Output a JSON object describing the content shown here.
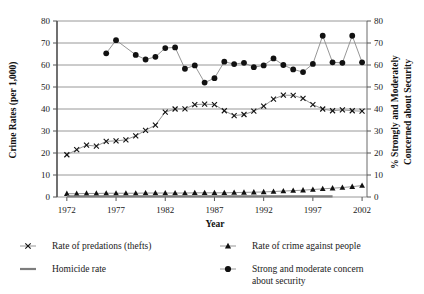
{
  "chart_data": {
    "type": "line",
    "title": "",
    "xlabel": "Year",
    "ylabel": "Crime Rates (per 1,000)",
    "y2label": "% Strongly and Moderately Concerned about Security",
    "xlim": [
      1971,
      2002.5
    ],
    "ylim": [
      0,
      80
    ],
    "y2lim": [
      0,
      80
    ],
    "grid": true,
    "legend_position": "bottom",
    "xticks": [
      "1972",
      "1977",
      "1982",
      "1987",
      "1992",
      "1997",
      "2002"
    ],
    "xtick_values": [
      1972,
      1977,
      1982,
      1987,
      1992,
      1997,
      2002
    ],
    "yticks": [
      "0",
      "10",
      "20",
      "30",
      "40",
      "50",
      "60",
      "70",
      "80"
    ],
    "ytick_values": [
      0,
      10,
      20,
      30,
      40,
      50,
      60,
      70,
      80
    ],
    "y2ticks": [
      "0",
      "10",
      "20",
      "30",
      "40",
      "50",
      "60",
      "70",
      "80"
    ],
    "y2tick_values": [
      0,
      10,
      20,
      30,
      40,
      50,
      60,
      70,
      80
    ],
    "series": [
      {
        "name": "Rate of predations (thefts)",
        "marker": "x",
        "axis": "left",
        "x": [
          1972,
          1973,
          1974,
          1975,
          1976,
          1977,
          1978,
          1979,
          1980,
          1981,
          1982,
          1983,
          1984,
          1985,
          1986,
          1987,
          1988,
          1989,
          1990,
          1991,
          1992,
          1993,
          1994,
          1995,
          1996,
          1997,
          1998,
          1999,
          2000,
          2001,
          2002
        ],
        "values": [
          19.2,
          21.5,
          23.6,
          23.1,
          25.3,
          25.5,
          26.0,
          27.8,
          30.3,
          32.7,
          38.6,
          40.0,
          40.1,
          42.0,
          42.2,
          42.0,
          39.2,
          37.0,
          37.5,
          39.0,
          41.3,
          44.5,
          46.3,
          46.2,
          44.8,
          42.0,
          40.0,
          39.2,
          39.6,
          39.2,
          39.0
        ]
      },
      {
        "name": "Rate of crime against people",
        "marker": "triangle",
        "axis": "left",
        "x": [
          1972,
          1973,
          1974,
          1975,
          1976,
          1977,
          1978,
          1979,
          1980,
          1981,
          1982,
          1983,
          1984,
          1985,
          1986,
          1987,
          1988,
          1989,
          1990,
          1991,
          1992,
          1993,
          1994,
          1995,
          1996,
          1997,
          1998,
          1999,
          2000,
          2001,
          2002
        ],
        "values": [
          1.5,
          1.5,
          1.6,
          1.6,
          1.7,
          1.7,
          1.7,
          1.7,
          1.8,
          1.8,
          1.8,
          1.8,
          1.8,
          1.9,
          1.9,
          1.9,
          1.9,
          2.0,
          2.1,
          2.2,
          2.3,
          2.5,
          2.7,
          2.9,
          3.1,
          3.4,
          3.7,
          4.0,
          4.3,
          4.7,
          5.2
        ]
      },
      {
        "name": "Homicide rate",
        "marker": "none",
        "axis": "left",
        "x": [
          1972,
          1975,
          1980,
          1985,
          1990,
          1995,
          1999
        ],
        "values": [
          0.3,
          0.3,
          0.3,
          0.3,
          0.3,
          0.3,
          0.3
        ]
      },
      {
        "name": "Strong and moderate concern about security",
        "marker": "circle",
        "axis": "right",
        "x": [
          1976,
          1977,
          1979,
          1980,
          1981,
          1982,
          1983,
          1984,
          1985,
          1986,
          1987,
          1988,
          1989,
          1990,
          1991,
          1992,
          1993,
          1994,
          1995,
          1996,
          1997,
          1998,
          1999,
          2000,
          2001,
          2002
        ],
        "values": [
          65.3,
          71.3,
          64.6,
          62.5,
          63.7,
          67.7,
          68.0,
          58.3,
          59.8,
          52.0,
          54.0,
          61.5,
          60.4,
          61.0,
          59.0,
          59.8,
          63.0,
          60.0,
          58.0,
          56.8,
          60.5,
          73.3,
          61.2,
          61.0,
          73.3,
          61.2
        ]
      }
    ]
  },
  "axes": {
    "left_title": "Crime Rates (per 1,000)",
    "right_title_line1": "% Strongly and Moderately",
    "right_title_line2": "Concerned about Security",
    "x_title": "Year"
  },
  "legend": {
    "items": [
      {
        "label": "Rate of predations (thefts)",
        "marker": "x"
      },
      {
        "label": "Rate of crime against people",
        "marker": "triangle"
      },
      {
        "label": "Homicide rate",
        "marker": "line"
      },
      {
        "label": "Strong and moderate concern",
        "label2": "about security",
        "marker": "circle"
      }
    ]
  },
  "colors": {
    "marker": "#111111",
    "line": "#8a8a8a",
    "grid": "#8c8c8c",
    "axis": "#4d4d4d",
    "text": "#1a1a1a",
    "background": "#ffffff"
  }
}
